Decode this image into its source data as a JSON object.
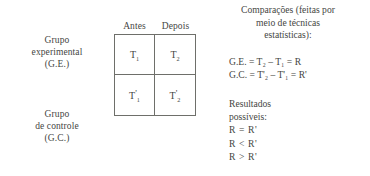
{
  "diagram": {
    "left_labels": {
      "experimental_group": {
        "line1": "Grupo",
        "line2": "experimental",
        "line3": "(G.E.)"
      },
      "control_group": {
        "line1": "Grupo",
        "line2": "de controle",
        "line3": "(G.C.)"
      }
    },
    "table": {
      "column_headers": [
        "Antes",
        "Depois"
      ],
      "rows": [
        {
          "cells": [
            {
              "base": "T",
              "prime": "",
              "sub": "1"
            },
            {
              "base": "T",
              "prime": "",
              "sub": "2"
            }
          ]
        },
        {
          "cells": [
            {
              "base": "T",
              "prime": "'",
              "sub": "1"
            },
            {
              "base": "T",
              "prime": "'",
              "sub": "2"
            }
          ]
        }
      ],
      "border_color": "#6e6f6a"
    },
    "right_column": {
      "comparisons_title": {
        "line1": "Comparações (feitas por",
        "line2": "meio de técnicas",
        "line3": "estatísticas):"
      },
      "equations": [
        "G.E. = T₂ – T₁ = R",
        "G.C. = T'₂ – T'₁ = R'"
      ],
      "results": {
        "title_line1": "Resultados",
        "title_line2": "possíveis:",
        "items": [
          "R = R'",
          "R < R'",
          "R > R'"
        ]
      }
    },
    "colors": {
      "text": "#45463f",
      "background": "#ffffff",
      "rule": "#6e6f6a"
    }
  }
}
